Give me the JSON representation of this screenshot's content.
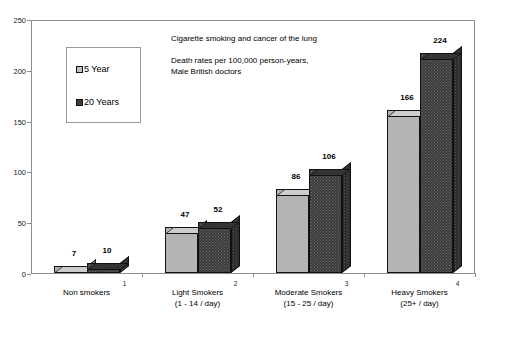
{
  "chart_data": {
    "type": "bar",
    "title": "Cigarette smoking and cancer of the lung",
    "subtitle_line1": "Death rates per 100,000 person-years,",
    "subtitle_line2": "Male British doctors",
    "xlabel": "",
    "ylabel": "",
    "ylim": [
      0,
      250
    ],
    "yticks": [
      0,
      50,
      100,
      150,
      200,
      250
    ],
    "grid": false,
    "legend_position": "upper-left-inset",
    "categories": [
      "Non smokers",
      "Light Smokers",
      "Moderate Smokers",
      "Heavy Smokers"
    ],
    "category_sublabels": [
      "",
      "(1 - 14 / day)",
      "(15 - 25 / day)",
      "(25+ / day)"
    ],
    "axis_tick_numbers": [
      "1",
      "2",
      "3",
      "4"
    ],
    "series": [
      {
        "name": "5 Year",
        "values": [
          7,
          47,
          86,
          166
        ]
      },
      {
        "name": "20 Years",
        "values": [
          10,
          52,
          106,
          224
        ]
      }
    ]
  },
  "legend": {
    "items": [
      {
        "label": "5 Year",
        "swatch": "light"
      },
      {
        "label": "20 Years",
        "swatch": "dark"
      }
    ]
  },
  "colors": {
    "series_5_year": "#b4b4b4",
    "series_20_years": "#3a3a3a",
    "frame": "#8c8c8c",
    "text": "#000000"
  }
}
